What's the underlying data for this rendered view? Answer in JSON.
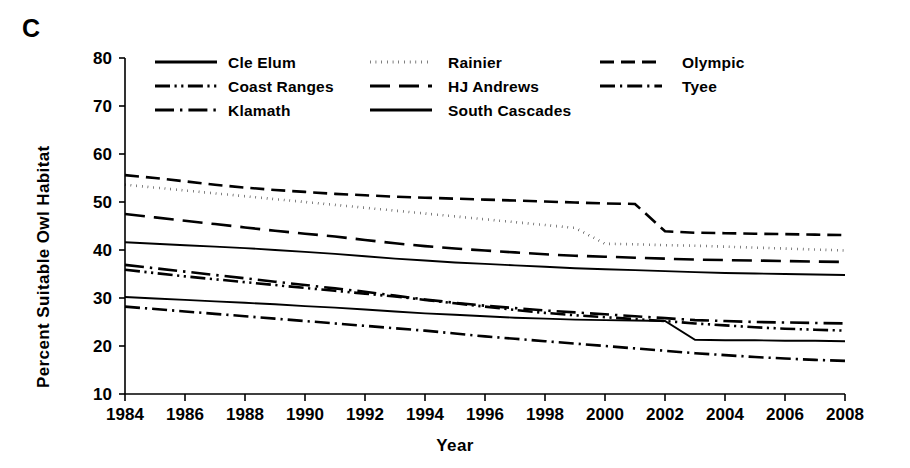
{
  "figure": {
    "panel_label": "C",
    "ylabel": "Percent Suitable Owl Habitat",
    "xlabel": "Year"
  },
  "chart_data": {
    "type": "line",
    "title": "C",
    "xlabel": "Year",
    "ylabel": "Percent Suitable Owl Habitat",
    "xlim": [
      1984,
      2008
    ],
    "ylim": [
      10,
      80
    ],
    "xticks": [
      1984,
      1986,
      1988,
      1990,
      1992,
      1994,
      1996,
      1998,
      2000,
      2002,
      2004,
      2006,
      2008
    ],
    "yticks": [
      10,
      20,
      30,
      40,
      50,
      60,
      70,
      80
    ],
    "grid": false,
    "legend_position": "top-inside",
    "legend_columns": 3,
    "x": [
      1984,
      1985,
      1986,
      1987,
      1988,
      1989,
      1990,
      1991,
      1992,
      1993,
      1994,
      1995,
      1996,
      1997,
      1998,
      1999,
      2000,
      2001,
      2002,
      2003,
      2004,
      2005,
      2006,
      2007,
      2008
    ],
    "series": [
      {
        "name": "Cle Elum",
        "dash": "solid",
        "values": [
          30.2,
          29.9,
          29.6,
          29.3,
          29.0,
          28.7,
          28.3,
          28.0,
          27.6,
          27.2,
          26.8,
          26.5,
          26.2,
          25.9,
          25.7,
          25.5,
          25.4,
          25.3,
          25.2,
          21.3,
          21.2,
          21.2,
          21.1,
          21.1,
          21.0
        ]
      },
      {
        "name": "Coast Ranges",
        "dash": "dash-dot-dot",
        "values": [
          35.9,
          35.2,
          34.5,
          33.9,
          33.3,
          32.7,
          32.1,
          31.5,
          30.9,
          30.3,
          29.6,
          28.9,
          28.2,
          27.5,
          26.9,
          26.4,
          26.0,
          25.6,
          25.2,
          24.7,
          24.3,
          23.9,
          23.6,
          23.4,
          23.2
        ]
      },
      {
        "name": "Klamath",
        "dash": "long-dash-dot",
        "values": [
          36.9,
          36.2,
          35.5,
          34.8,
          34.1,
          33.4,
          32.7,
          32.0,
          31.3,
          30.5,
          29.7,
          29.0,
          28.4,
          27.9,
          27.4,
          27.0,
          26.6,
          26.2,
          25.8,
          25.4,
          25.2,
          25.0,
          24.9,
          24.8,
          24.7
        ]
      },
      {
        "name": "Rainier",
        "dash": "dotted",
        "values": [
          53.6,
          53.0,
          52.4,
          51.8,
          51.2,
          50.6,
          50.0,
          49.4,
          48.8,
          48.2,
          47.6,
          47.0,
          46.4,
          45.8,
          45.2,
          44.6,
          41.3,
          41.2,
          41.0,
          40.9,
          40.7,
          40.5,
          40.3,
          40.1,
          39.9
        ]
      },
      {
        "name": "HJ Andrews",
        "dash": "long-dash",
        "values": [
          47.5,
          46.8,
          46.1,
          45.4,
          44.7,
          44.0,
          43.4,
          42.8,
          42.1,
          41.4,
          40.8,
          40.3,
          39.9,
          39.5,
          39.1,
          38.8,
          38.6,
          38.4,
          38.2,
          38.0,
          37.9,
          37.8,
          37.7,
          37.6,
          37.5
        ]
      },
      {
        "name": "South Cascades",
        "dash": "solid",
        "values": [
          41.6,
          41.3,
          41.0,
          40.7,
          40.4,
          40.0,
          39.6,
          39.2,
          38.7,
          38.2,
          37.8,
          37.4,
          37.1,
          36.8,
          36.5,
          36.2,
          36.0,
          35.8,
          35.6,
          35.4,
          35.2,
          35.1,
          35.0,
          34.9,
          34.8
        ]
      },
      {
        "name": "Olympic",
        "dash": "dash",
        "values": [
          55.6,
          55.0,
          54.3,
          53.6,
          53.0,
          52.5,
          52.1,
          51.7,
          51.4,
          51.1,
          50.9,
          50.7,
          50.5,
          50.3,
          50.1,
          49.9,
          49.7,
          49.6,
          43.9,
          43.6,
          43.5,
          43.4,
          43.3,
          43.2,
          43.1
        ]
      },
      {
        "name": "Tyee",
        "dash": "dash-dot",
        "values": [
          28.2,
          27.7,
          27.2,
          26.7,
          26.2,
          25.7,
          25.2,
          24.7,
          24.2,
          23.7,
          23.2,
          22.6,
          22.0,
          21.5,
          21.0,
          20.5,
          20.0,
          19.5,
          19.0,
          18.5,
          18.1,
          17.7,
          17.4,
          17.1,
          16.9
        ]
      }
    ],
    "legend": [
      {
        "label": "Cle Elum",
        "dash": "solid",
        "col": 0,
        "row": 0
      },
      {
        "label": "Coast Ranges",
        "dash": "dash-dot-dot",
        "col": 0,
        "row": 1
      },
      {
        "label": "Klamath",
        "dash": "long-dash-dot",
        "col": 0,
        "row": 2
      },
      {
        "label": "Rainier",
        "dash": "dotted",
        "col": 1,
        "row": 0
      },
      {
        "label": "HJ Andrews",
        "dash": "long-dash",
        "col": 1,
        "row": 1
      },
      {
        "label": "South Cascades",
        "dash": "solid",
        "col": 1,
        "row": 2
      },
      {
        "label": "Olympic",
        "dash": "dash",
        "col": 2,
        "row": 0
      },
      {
        "label": "Tyee",
        "dash": "dash-dot",
        "col": 2,
        "row": 1
      }
    ]
  },
  "colors": {
    "ink": "#000000",
    "background": "#ffffff"
  }
}
